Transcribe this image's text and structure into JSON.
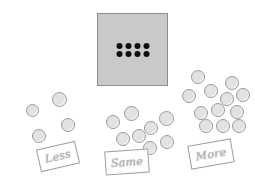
{
  "scene": {
    "title": "Less / Same / More counter sorting activity",
    "background_color": "#ffffff"
  },
  "reference_card": {
    "name": "reference-dot-card",
    "fill_color": "#c9c9c9",
    "border_color": "#8d8d8d",
    "dot_color": "#0d0d0d",
    "dot_count": 8,
    "dot_rows": 2,
    "dot_columns": 4,
    "x": 97,
    "y": 13,
    "width": 71,
    "height": 73
  },
  "counter_style": {
    "fill_color": "#e2e2e2",
    "border_color": "#9a9a9a"
  },
  "groups": [
    {
      "id": "less",
      "label": "Less",
      "count": 4,
      "counters": [
        {
          "x": 12,
          "y": 22,
          "d": 13
        },
        {
          "x": 38,
          "y": 10,
          "d": 15
        },
        {
          "x": 47,
          "y": 36,
          "d": 14
        },
        {
          "x": 18,
          "y": 47,
          "d": 14
        }
      ],
      "label_card": {
        "x": 38,
        "y": 145,
        "width": 40,
        "height": 23,
        "rotation": -13
      }
    },
    {
      "id": "same",
      "label": "Same",
      "count": 8,
      "counters": [
        {
          "x": 6,
          "y": 16,
          "d": 14
        },
        {
          "x": 24,
          "y": 7,
          "d": 15
        },
        {
          "x": 44,
          "y": 22,
          "d": 14
        },
        {
          "x": 59,
          "y": 12,
          "d": 15
        },
        {
          "x": 16,
          "y": 33,
          "d": 14
        },
        {
          "x": 32,
          "y": 30,
          "d": 14
        },
        {
          "x": 43,
          "y": 42,
          "d": 14
        },
        {
          "x": 60,
          "y": 36,
          "d": 14
        }
      ],
      "label_card": {
        "x": 105,
        "y": 150,
        "width": 44,
        "height": 24,
        "rotation": -4
      }
    },
    {
      "id": "more",
      "label": "More",
      "count": 12,
      "counters": [
        {
          "x": 9,
          "y": 0,
          "d": 14
        },
        {
          "x": 43,
          "y": 6,
          "d": 14
        },
        {
          "x": 0,
          "y": 19,
          "d": 14
        },
        {
          "x": 22,
          "y": 14,
          "d": 14
        },
        {
          "x": 38,
          "y": 22,
          "d": 14
        },
        {
          "x": 54,
          "y": 18,
          "d": 14
        },
        {
          "x": 48,
          "y": 35,
          "d": 14
        },
        {
          "x": 29,
          "y": 33,
          "d": 14
        },
        {
          "x": 12,
          "y": 36,
          "d": 14
        },
        {
          "x": 17,
          "y": 49,
          "d": 14
        },
        {
          "x": 34,
          "y": 49,
          "d": 14
        },
        {
          "x": 50,
          "y": 49,
          "d": 14
        }
      ],
      "label_card": {
        "x": 189,
        "y": 142,
        "width": 44,
        "height": 24,
        "rotation": -10
      }
    }
  ],
  "group_origins": {
    "less": {
      "x": 14,
      "y": 82
    },
    "same": {
      "x": 100,
      "y": 99
    },
    "more": {
      "x": 182,
      "y": 70
    }
  }
}
